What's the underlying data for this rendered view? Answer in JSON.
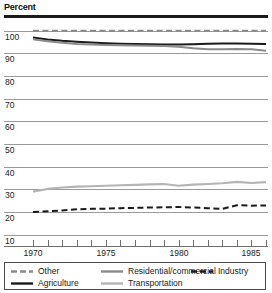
{
  "title": "Percent",
  "axis": {
    "y_labels": [
      "100",
      "90",
      "80",
      "70",
      "60",
      "50",
      "40",
      "30",
      "20",
      "10"
    ],
    "x_labels": [
      "1970",
      "1975",
      "1980",
      "1985"
    ]
  },
  "legend": {
    "items": [
      {
        "label": "Other",
        "style": "dashed",
        "color": "#8a8a8a"
      },
      {
        "label": "Residential/commercial",
        "style": "solid",
        "color": "#8a8a8a"
      },
      {
        "label": "Industry",
        "style": "dashed",
        "color": "#1a1a1a"
      },
      {
        "label": "Agriculture",
        "style": "solid",
        "color": "#1a1a1a"
      },
      {
        "label": "Transportation",
        "style": "solid",
        "color": "#b4b4b4"
      }
    ]
  },
  "chart_data": {
    "type": "line",
    "title": "Percent",
    "xlabel": "",
    "ylabel": "Percent",
    "xlim": [
      1969.5,
      1986.5
    ],
    "ylim": [
      5,
      103
    ],
    "yticks": [
      10,
      20,
      30,
      40,
      50,
      60,
      70,
      80,
      90,
      100
    ],
    "xticks": [
      1970,
      1971,
      1972,
      1973,
      1974,
      1975,
      1976,
      1977,
      1978,
      1979,
      1980,
      1981,
      1982,
      1983,
      1984,
      1985,
      1986
    ],
    "xtick_labels": [
      "1970",
      "",
      "",
      "",
      "",
      "1975",
      "",
      "",
      "",
      "",
      "1980",
      "",
      "",
      "",
      "",
      "1985",
      ""
    ],
    "grid": true,
    "legend_position": "bottom",
    "x": [
      1970,
      1971,
      1972,
      1973,
      1974,
      1975,
      1976,
      1977,
      1978,
      1979,
      1980,
      1981,
      1982,
      1983,
      1984,
      1985,
      1986
    ],
    "series": [
      {
        "name": "Other",
        "style": "dashed",
        "color": "#8a8a8a",
        "values": [
          100,
          100,
          100,
          100,
          100,
          100,
          100,
          100,
          100,
          100,
          100,
          100,
          100,
          100,
          100,
          100,
          100
        ]
      },
      {
        "name": "Agriculture",
        "style": "solid",
        "color": "#1a1a1a",
        "values": [
          97.0,
          96.2,
          95.6,
          95.2,
          94.8,
          94.5,
          94.3,
          94.2,
          94.1,
          94.0,
          94.0,
          94.1,
          94.3,
          94.4,
          94.4,
          94.3,
          94.2
        ]
      },
      {
        "name": "Residential/commercial",
        "style": "solid",
        "color": "#8a8a8a",
        "values": [
          96.3,
          95.4,
          94.7,
          94.2,
          93.9,
          93.7,
          93.6,
          93.5,
          93.4,
          93.3,
          93.0,
          92.3,
          91.8,
          91.9,
          92.0,
          91.8,
          91.2
        ]
      },
      {
        "name": "Transportation",
        "style": "solid",
        "color": "#b4b4b4",
        "values": [
          29.0,
          30.2,
          30.8,
          31.2,
          31.4,
          31.6,
          31.8,
          32.0,
          32.2,
          32.4,
          31.6,
          32.1,
          32.4,
          32.7,
          33.3,
          32.8,
          33.2
        ]
      },
      {
        "name": "Industry",
        "style": "dashed",
        "color": "#1a1a1a",
        "values": [
          20.0,
          20.3,
          20.7,
          21.2,
          21.4,
          21.5,
          21.7,
          21.8,
          22.0,
          22.1,
          22.2,
          22.0,
          21.7,
          21.4,
          23.0,
          22.8,
          22.9
        ]
      }
    ]
  }
}
